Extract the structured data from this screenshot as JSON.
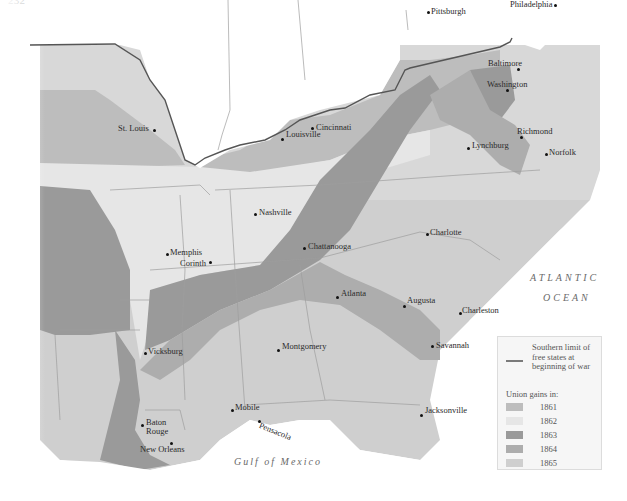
{
  "running_head": {
    "page": "232",
    "text": "Chapter 10 · CIVIL WAR AND RECONSTRUCTION, 1861–1877"
  },
  "colors": {
    "free_states": "#ffffff",
    "y1861": "#bdbdbd",
    "y1862": "#e6e6e6",
    "y1863": "#9a9a9a",
    "y1864": "#adadad",
    "y1865": "#cfcfcf",
    "border": "#555555",
    "state_line": "#9e9e9e"
  },
  "cities": [
    {
      "name": "Pittsburgh",
      "x": 428,
      "y": 11
    },
    {
      "name": "Philadelphia",
      "x": 553,
      "y": 3
    },
    {
      "name": "Baltimore",
      "x": 488,
      "y": 62
    },
    {
      "name": "Washington",
      "x": 486,
      "y": 82
    },
    {
      "name": "Cincinnati",
      "x": 313,
      "y": 127
    },
    {
      "name": "St. Louis",
      "x": 154,
      "y": 129
    },
    {
      "name": "Louisville",
      "x": 282,
      "y": 138
    },
    {
      "name": "Richmond",
      "x": 520,
      "y": 137
    },
    {
      "name": "Norfolk",
      "x": 545,
      "y": 154
    },
    {
      "name": "Lynchburg",
      "x": 468,
      "y": 147
    },
    {
      "name": "Nashville",
      "x": 255,
      "y": 214
    },
    {
      "name": "Charlotte",
      "x": 427,
      "y": 234
    },
    {
      "name": "Chattanooga",
      "x": 304,
      "y": 248
    },
    {
      "name": "Memphis",
      "x": 167,
      "y": 254
    },
    {
      "name": "Corinth",
      "x": 210,
      "y": 262
    },
    {
      "name": "Atlanta",
      "x": 337,
      "y": 297
    },
    {
      "name": "Augusta",
      "x": 404,
      "y": 306
    },
    {
      "name": "Charleston",
      "x": 459,
      "y": 312
    },
    {
      "name": "Vicksburg",
      "x": 145,
      "y": 353
    },
    {
      "name": "Montgomery",
      "x": 278,
      "y": 348
    },
    {
      "name": "Savannah",
      "x": 431,
      "y": 345
    },
    {
      "name": "Mobile",
      "x": 232,
      "y": 408
    },
    {
      "name": "Pensacola",
      "x": 258,
      "y": 419
    },
    {
      "name": "Baton Rouge",
      "x": 142,
      "y": 424
    },
    {
      "name": "New Orleans",
      "x": 171,
      "y": 443
    },
    {
      "name": "Jacksonville",
      "x": 421,
      "y": 414
    }
  ],
  "water_labels": {
    "atlantic_1": "ATLANTIC",
    "atlantic_2": "OCEAN",
    "gulf": "Gulf of Mexico"
  },
  "legend": {
    "limit_label": "Southern limit of free states at beginning of war",
    "gains_title": "Union gains in:",
    "items": [
      {
        "year": "1861",
        "color": "#bdbdbd"
      },
      {
        "year": "1862",
        "color": "#e6e6e6"
      },
      {
        "year": "1863",
        "color": "#9a9a9a"
      },
      {
        "year": "1864",
        "color": "#adadad"
      },
      {
        "year": "1865",
        "color": "#cfcfcf"
      }
    ]
  }
}
